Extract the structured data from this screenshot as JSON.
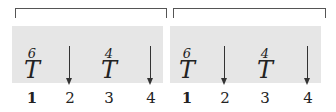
{
  "groups": [
    {
      "columns": [
        {
          "index": "1",
          "type": "T",
          "symbol": "T",
          "superscript": "6"
        },
        {
          "index": "2",
          "type": "arrow",
          "symbol": "down-arrow"
        },
        {
          "index": "3",
          "type": "T",
          "symbol": "T",
          "superscript": "4"
        },
        {
          "index": "4",
          "type": "arrow",
          "symbol": "down-arrow"
        }
      ]
    },
    {
      "columns": [
        {
          "index": "1",
          "type": "T",
          "symbol": "T",
          "superscript": "6"
        },
        {
          "index": "2",
          "type": "arrow",
          "symbol": "down-arrow"
        },
        {
          "index": "3",
          "type": "T",
          "symbol": "T",
          "superscript": "4"
        },
        {
          "index": "4",
          "type": "arrow",
          "symbol": "down-arrow"
        }
      ]
    }
  ],
  "colors": {
    "band": "#e6e6e6",
    "ink": "#222222",
    "bracket": "#555555"
  }
}
